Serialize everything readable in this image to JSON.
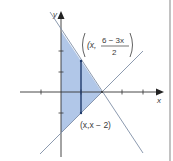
{
  "figure": {
    "type": "region-between-lines",
    "axes": {
      "x_label": "x",
      "y_label": "y",
      "tick_spacing_units": 1,
      "x_ticks": [
        -2,
        -1,
        1,
        2,
        3,
        4
      ],
      "y_ticks": [
        -3,
        -2,
        -1,
        1,
        2,
        3
      ]
    },
    "lines": [
      {
        "name": "upper-boundary",
        "equation": "y = (6 - 3x)/2"
      },
      {
        "name": "lower-boundary",
        "equation": "y = x - 2"
      }
    ],
    "region": {
      "vertices": [
        [
          0,
          3
        ],
        [
          2,
          0
        ],
        [
          0,
          -2
        ]
      ],
      "fill_color": "#a9c1e6"
    },
    "sample_segment": {
      "x": 1,
      "y_top": 1.5,
      "y_bottom": -1
    },
    "labels": {
      "top_point_prefix": "(x,",
      "top_point_numerator": "6 − 3x",
      "top_point_denominator": "2",
      "bottom_point": "(x,x − 2)"
    },
    "colors": {
      "line": "#7f8fa6",
      "axis": "#333333",
      "segment": "#1f3a6b",
      "border": "#9a9a9a"
    }
  }
}
